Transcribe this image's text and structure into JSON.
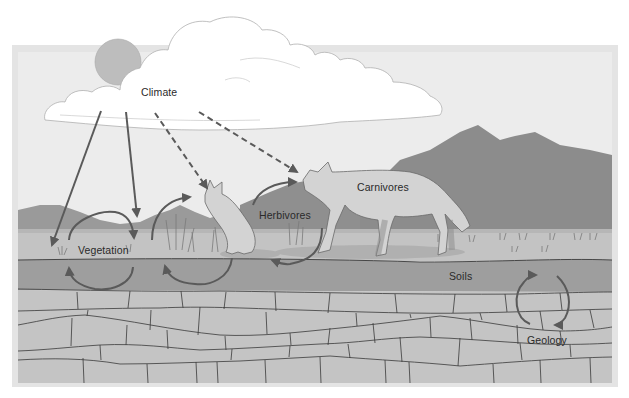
{
  "diagram": {
    "colors": {
      "frame": "#e2e2e2",
      "sky": "#ececec",
      "sun": "#bdbdbd",
      "cloud_fill": "#ffffff",
      "cloud_stroke": "#b0b0b0",
      "mountain_far": "#9a9a9a",
      "mountain_near": "#8a8a8a",
      "grass_strip": "#c2c2c2",
      "grass_top_band": "#b2b2b2",
      "soil": "#9c9c9c",
      "rock": "#c4c4c4",
      "rock_lines": "#3a3a3a",
      "arrow": "#5a5a5a",
      "animal_fill": "#d3d3d3",
      "text": "#2a2a2a"
    },
    "labels": {
      "climate": "Climate",
      "vegetation": "Vegetation",
      "herbivores": "Herbivores",
      "carnivores": "Carnivores",
      "soils": "Soils",
      "geology": "Geology"
    },
    "nodes": [
      {
        "id": "climate",
        "label": "Climate",
        "x": 141,
        "y": 88
      },
      {
        "id": "vegetation",
        "label": "Vegetation",
        "x": 78,
        "y": 246
      },
      {
        "id": "herbivores",
        "label": "Herbivores",
        "x": 259,
        "y": 210
      },
      {
        "id": "carnivores",
        "label": "Carnivores",
        "x": 357,
        "y": 183
      },
      {
        "id": "soils",
        "label": "Soils",
        "x": 449,
        "y": 272
      },
      {
        "id": "geology",
        "label": "Geology",
        "x": 527,
        "y": 336
      }
    ],
    "edges": [
      {
        "from": "climate",
        "to": "vegetation",
        "style": "solid"
      },
      {
        "from": "climate",
        "to": "vegetation",
        "style": "solid"
      },
      {
        "from": "climate",
        "to": "herbivores",
        "style": "dashed"
      },
      {
        "from": "climate",
        "to": "carnivores",
        "style": "dashed"
      },
      {
        "from": "vegetation",
        "to": "soils",
        "style": "cycle"
      },
      {
        "from": "vegetation",
        "to": "herbivores",
        "style": "cycle"
      },
      {
        "from": "herbivores",
        "to": "carnivores",
        "style": "curved"
      },
      {
        "from": "herbivores",
        "to": "soils",
        "style": "curved"
      },
      {
        "from": "soils",
        "to": "geology",
        "style": "cycle"
      }
    ]
  }
}
